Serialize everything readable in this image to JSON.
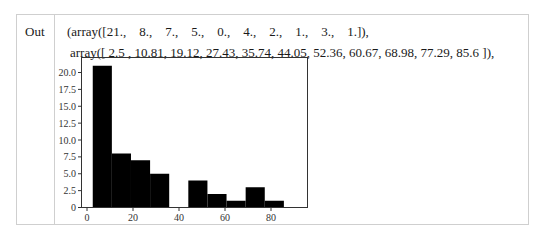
{
  "cell": {
    "prompt_label": "Out",
    "output_lines": [
      "(array([21.,    8.,    7.,    5.,    0.,    4.,    2.,    1.,    3.,    1.]),",
      "array([ 2.5 , 10.81, 19.12, 27.43, 35.74, 44.05, 52.36, 60.67, 68.98, 77.29, 85.6 ]),"
    ]
  },
  "chart_data": {
    "type": "bar",
    "subtype": "histogram",
    "title": "",
    "xlabel": "",
    "ylabel": "",
    "counts": [
      21,
      8,
      7,
      5,
      0,
      4,
      2,
      1,
      3,
      1
    ],
    "bin_edges": [
      2.5,
      10.81,
      19.12,
      27.43,
      35.74,
      44.05,
      52.36,
      60.67,
      68.98,
      77.29,
      85.6
    ],
    "x_ticks": [
      "0",
      "20",
      "40",
      "60",
      "80"
    ],
    "y_ticks": [
      "0",
      "2.5",
      "5.0",
      "7.5",
      "10.0",
      "12.5",
      "15.0",
      "17.5",
      "20.0"
    ],
    "xlim": [
      -2.6,
      90.8
    ],
    "ylim": [
      0,
      22.2
    ],
    "grid": false,
    "bar_color": "#000000"
  }
}
